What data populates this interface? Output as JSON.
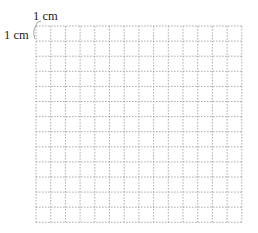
{
  "diagram": {
    "type": "square-grid",
    "top_label": "1 cm",
    "left_label": "1 cm",
    "grid": {
      "columns": 14,
      "rows": 13,
      "origin_x": 36,
      "origin_y": 26,
      "cell_width": 14.7,
      "cell_height": 15.1,
      "line_style": "dashed",
      "line_color": "#9a9a9a"
    },
    "bracket_color": "#8a8a8a"
  }
}
